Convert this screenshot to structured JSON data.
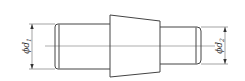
{
  "diagram": {
    "type": "shaft-drawing",
    "colors": {
      "line": "#444444",
      "background": "#ffffff"
    },
    "dimensions": [
      {
        "id": "d1",
        "symbol": "ϕ",
        "letter": "d",
        "subscript": "1",
        "position": "left"
      },
      {
        "id": "d2",
        "symbol": "ϕ",
        "letter": "d",
        "subscript": "2",
        "position": "right"
      }
    ]
  },
  "labels": {
    "d1_symbol": "ϕd",
    "d1_sub": "1",
    "d2_symbol": "ϕd",
    "d2_sub": "2"
  }
}
